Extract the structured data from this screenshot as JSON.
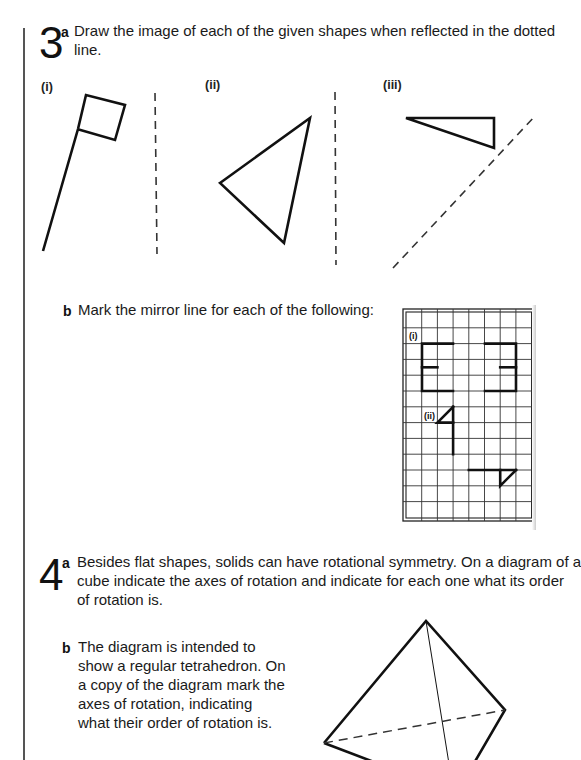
{
  "q3": {
    "number": "3",
    "part_a": {
      "label": "a",
      "text_line1": "Draw the image of each of the given shapes when reflected in the dotted",
      "text_line2": "line.",
      "sublabels": [
        "(i)",
        "(ii)",
        "(iii)"
      ],
      "figures": {
        "i": {
          "shape": "flag",
          "mirror": "vertical dashed line"
        },
        "ii": {
          "shape": "triangle",
          "mirror": "vertical dashed line"
        },
        "iii": {
          "shape": "right triangle",
          "mirror": "diagonal dashed line"
        }
      }
    },
    "part_b": {
      "label": "b",
      "text": "Mark the mirror line for each of the following:",
      "grid": {
        "columns": 8,
        "rows": 13,
        "labels": [
          "(i)",
          "(ii)"
        ]
      }
    }
  },
  "q4": {
    "number": "4",
    "part_a": {
      "label": "a",
      "lines": [
        "Besides flat shapes, solids can have rotational symmetry. On a diagram of a",
        "cube indicate the axes of rotation and indicate for each one what its order",
        "of rotation is."
      ]
    },
    "part_b": {
      "label": "b",
      "lines": [
        "The diagram is intended to",
        "show a regular tetrahedron. On",
        "a copy of the diagram mark the",
        "axes of rotation, indicating",
        "what their order of rotation is."
      ],
      "figure": "tetrahedron"
    }
  }
}
